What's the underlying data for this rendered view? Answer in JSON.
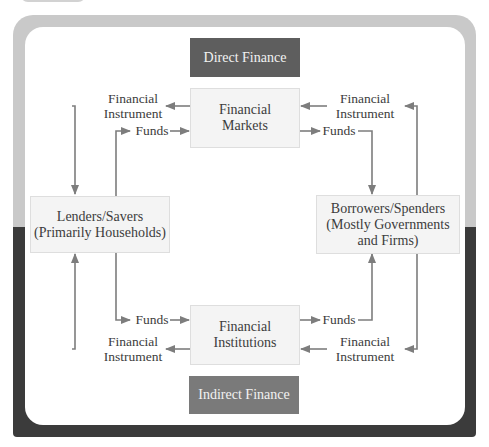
{
  "diagram": {
    "banners": {
      "direct": "Direct Finance",
      "indirect": "Indirect Finance"
    },
    "nodes": {
      "markets_line1": "Financial",
      "markets_line2": "Markets",
      "institutions_line1": "Financial",
      "institutions_line2": "Institutions",
      "lenders_line1": "Lenders/Savers",
      "lenders_line2": "(Primarily Households)",
      "borrowers_line1": "Borrowers/Spenders",
      "borrowers_line2": "(Mostly Governments",
      "borrowers_line3": "and Firms)"
    },
    "flow_labels": {
      "top_left_instrument_1": "Financial",
      "top_left_instrument_2": "Instrument",
      "top_left_funds": "Funds",
      "top_right_instrument_1": "Financial",
      "top_right_instrument_2": "Instrument",
      "top_right_funds": "Funds",
      "bottom_left_funds": "Funds",
      "bottom_left_instrument_1": "Financial",
      "bottom_left_instrument_2": "Instrument",
      "bottom_right_funds": "Funds",
      "bottom_right_instrument_1": "Financial",
      "bottom_right_instrument_2": "Instrument"
    },
    "colors": {
      "frame_top": "#c9c9c9",
      "frame_bottom": "#3b3b3b",
      "direct_banner": "#5e5e5e",
      "indirect_banner": "#7a7a7a",
      "arrow": "#7d7d7d",
      "node_fill": "#f4f4f4"
    }
  }
}
